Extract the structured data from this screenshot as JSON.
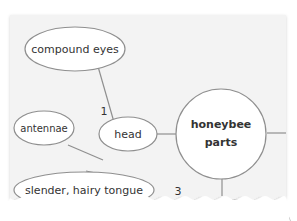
{
  "diagram": {
    "center": {
      "label_line1": "honeybee",
      "label_line2": "parts"
    },
    "nodes": [
      {
        "id": "compound-eyes",
        "label": "compound eyes"
      },
      {
        "id": "antennae",
        "label": "antennae"
      },
      {
        "id": "head",
        "label": "head"
      },
      {
        "id": "tongue",
        "label": "slender, hairy tongue"
      }
    ],
    "numbers": {
      "n1": "1",
      "n3": "3"
    },
    "colors": {
      "paper": "#f3f3f3",
      "stroke": "#8a8a8a",
      "text": "#333333"
    }
  }
}
